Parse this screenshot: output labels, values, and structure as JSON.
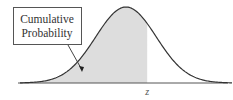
{
  "diagram": {
    "callout_lines": [
      "Cumulative",
      "Probability"
    ],
    "axis_label": "z",
    "colors": {
      "curve": "#333333",
      "shade": "#dddddd",
      "axis": "#555555",
      "box_border": "#555555"
    }
  },
  "chart_data": {
    "type": "area",
    "title": "",
    "xlabel": "z",
    "ylabel": "",
    "distribution": "normal",
    "mean": 0,
    "sd": 1,
    "xlim": [
      -3.5,
      3.5
    ],
    "shaded_region": {
      "from": "-inf",
      "to": "z"
    },
    "shaded_up_to": 0.7,
    "annotations": [
      "Cumulative Probability"
    ]
  }
}
